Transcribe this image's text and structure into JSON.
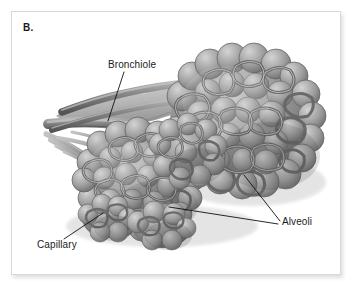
{
  "figure": {
    "panel_letter": "B.",
    "style": "grayscale-medical-illustration",
    "background_color": "#ffffff",
    "card_border_color": "#d8d8d8"
  },
  "labels": {
    "bronchiole": "Bronchiole",
    "alveoli": "Alveoli",
    "capillary": "Capillary"
  },
  "leaders": {
    "bronchiole": "M 112 60 L 96 109",
    "alveoli_upper": "M 268 209 L 232 163",
    "alveoli_lower": "M 266 212 L 157 195",
    "capillary": "M 52 227 L 91 201"
  },
  "palette": {
    "ink": "#1b1b1b",
    "tissue_dark": "#4a4a4a",
    "tissue_mid": "#7d7d7d",
    "tissue_light": "#b9b9b9",
    "tissue_highlight": "#d7d7d7",
    "duct_wall": "#a9a9a9",
    "shadow": "#3a3a3a"
  }
}
